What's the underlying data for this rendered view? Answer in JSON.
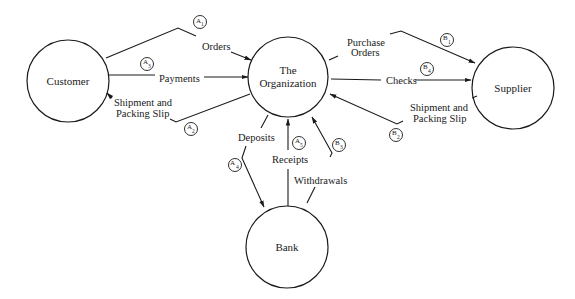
{
  "diagram": {
    "type": "context data flow diagram",
    "nodes": [
      {
        "id": "customer",
        "label": "Customer"
      },
      {
        "id": "org",
        "label_line1": "The",
        "label_line2": "Organization"
      },
      {
        "id": "supplier",
        "label": "Supplier"
      },
      {
        "id": "bank",
        "label": "Bank"
      }
    ],
    "flows": {
      "orders": {
        "label": "Orders",
        "tag": "A",
        "sub": "1",
        "from": "Customer",
        "to": "The Organization"
      },
      "payments": {
        "label": "Payments",
        "tag": "A",
        "sub": "3",
        "from": "Customer",
        "to": "The Organization"
      },
      "shipment_customer": {
        "label_line1": "Shipment and",
        "label_line2": "Packing Slip",
        "tag": "A",
        "sub": "2",
        "from": "The Organization",
        "to": "Customer"
      },
      "purchase_orders": {
        "label_line1": "Purchase",
        "label_line2": "Orders",
        "tag": "B",
        "sub": "1",
        "from": "The Organization",
        "to": "Supplier"
      },
      "checks": {
        "label": "Checks",
        "tag": "B",
        "sub": "4",
        "from": "The Organization",
        "to": "Supplier"
      },
      "shipment_supplier": {
        "label_line1": "Shipment and",
        "label_line2": "Packing Slip",
        "tag": "B",
        "sub": "2",
        "from": "Supplier",
        "to": "The Organization"
      },
      "deposits": {
        "label": "Deposits",
        "tag": "A",
        "sub": "4",
        "from": "The Organization",
        "to": "Bank"
      },
      "receipts": {
        "label": "Receipts",
        "tag": "A",
        "sub": "5",
        "from": "Bank",
        "to": "The Organization"
      },
      "withdrawals": {
        "label": "Withdrawals",
        "tag": "B",
        "sub": "3",
        "from": "Bank",
        "to": "The Organization"
      }
    }
  }
}
